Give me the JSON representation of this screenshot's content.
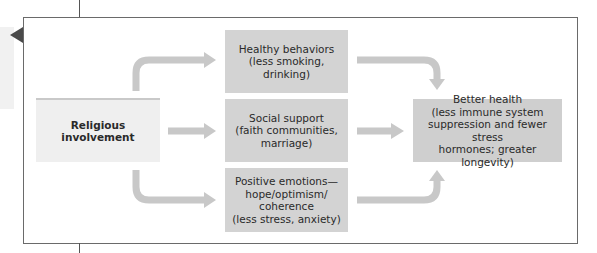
{
  "diagram": {
    "source": {
      "label": "Religious involvement"
    },
    "mediators": [
      {
        "lines": [
          "Healthy behaviors",
          "(less smoking, drinking)"
        ]
      },
      {
        "lines": [
          "Social support",
          "(faith communities,",
          "marriage)"
        ]
      },
      {
        "lines": [
          "Positive emotions—",
          "hope/optimism/",
          "coherence",
          "(less stress, anxiety)"
        ]
      }
    ],
    "outcome": {
      "lines": [
        "Better health",
        "(less immune system",
        "suppression and fewer stress",
        "hormones; greater longevity)"
      ]
    },
    "colors": {
      "arrow": "#c8c8c8",
      "source_box": "#efefef",
      "mediator_box": "#d3d3d3",
      "outcome_box": "#cfcfcf",
      "frame_border": "#6a6a6a",
      "marker": "#4a4a4a"
    }
  }
}
